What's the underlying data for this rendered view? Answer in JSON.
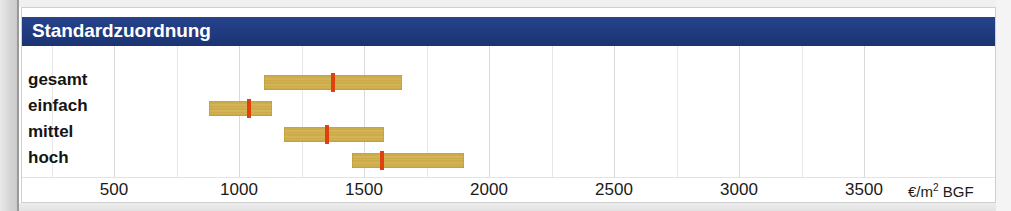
{
  "header": {
    "title": "Standardzuordnung",
    "band_color": "#1f3a7e",
    "text_color": "#ffffff"
  },
  "axis": {
    "unit_label": "€/m² BGF",
    "unit_currency": "€/m",
    "unit_exponent": "2",
    "unit_suffix": "BGF",
    "ticks": [
      500,
      1000,
      1500,
      2000,
      2500,
      3000,
      3500
    ],
    "tick_labels": [
      "500",
      "1000",
      "1500",
      "2000",
      "2500",
      "3000",
      "3500"
    ]
  },
  "colors": {
    "bar": "#cdae4d",
    "marker": "#e0400c",
    "grid": "#d9d9d9",
    "header": "#1f3a7e"
  },
  "chart_data": {
    "type": "bar",
    "title": "Standardzuordnung",
    "xlabel": "€/m² BGF",
    "ylabel": "",
    "xlim": [
      0,
      3750
    ],
    "grid": true,
    "legend": "none",
    "orientation": "horizontal",
    "note": "Range bars (min–max) with a red median/mean marker per category",
    "categories": [
      "gesamt",
      "einfach",
      "mittel",
      "hoch"
    ],
    "series": [
      {
        "name": "Spannweite von",
        "values": [
          1100,
          880,
          1180,
          1450
        ]
      },
      {
        "name": "Spannweite bis",
        "values": [
          1650,
          1130,
          1580,
          1900
        ]
      },
      {
        "name": "Mittelwert",
        "values": [
          1375,
          1040,
          1350,
          1570
        ]
      }
    ],
    "rows": [
      {
        "label": "gesamt",
        "low": 1100,
        "high": 1650,
        "marker": 1375
      },
      {
        "label": "einfach",
        "low": 880,
        "high": 1130,
        "marker": 1040
      },
      {
        "label": "mittel",
        "low": 1180,
        "high": 1580,
        "marker": 1350
      },
      {
        "label": "hoch",
        "low": 1450,
        "high": 1900,
        "marker": 1570
      }
    ]
  }
}
